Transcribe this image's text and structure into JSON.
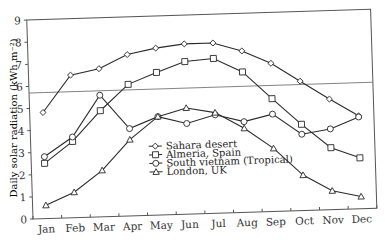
{
  "chart_data": {
    "type": "line",
    "title": "",
    "xlabel": "",
    "ylabel": "Daily solar radiation (kWh m⁻²)",
    "ylim": [
      0,
      9
    ],
    "yticks": [
      0,
      1,
      2,
      3,
      4,
      5,
      6,
      7,
      8,
      9
    ],
    "categories": [
      "Jan",
      "Feb",
      "Mar",
      "Apr",
      "May",
      "Jun",
      "Jul",
      "Aug",
      "Sep",
      "Oct",
      "Nov",
      "Dec"
    ],
    "series": [
      {
        "name": "Sahara desert",
        "marker": "diamond",
        "values": [
          4.8,
          6.45,
          6.7,
          7.3,
          7.55,
          7.7,
          7.7,
          7.3,
          6.7,
          5.85,
          5.0,
          4.2
        ]
      },
      {
        "name": "Almeria, Spain",
        "marker": "square",
        "values": [
          2.5,
          3.45,
          4.8,
          5.95,
          6.45,
          6.9,
          7.0,
          6.35,
          5.1,
          3.9,
          2.8,
          2.3
        ]
      },
      {
        "name": "South vietnam (Tropical)",
        "marker": "circle",
        "values": [
          2.8,
          3.65,
          5.5,
          3.95,
          4.45,
          4.1,
          4.45,
          4.1,
          4.4,
          3.45,
          3.65,
          4.15
        ]
      },
      {
        "name": "London, UK",
        "marker": "triangle",
        "values": [
          0.6,
          1.15,
          2.1,
          3.45,
          4.45,
          4.8,
          4.55,
          3.8,
          2.85,
          1.6,
          0.85,
          0.55
        ]
      }
    ],
    "reference_line": {
      "y": 5.7,
      "orientation": "horizontal"
    },
    "grid": false,
    "legend_position": "inside-lower-center"
  },
  "colors": {
    "line": "#2a2a2a",
    "axis": "#444444",
    "background": "#ffffff"
  }
}
